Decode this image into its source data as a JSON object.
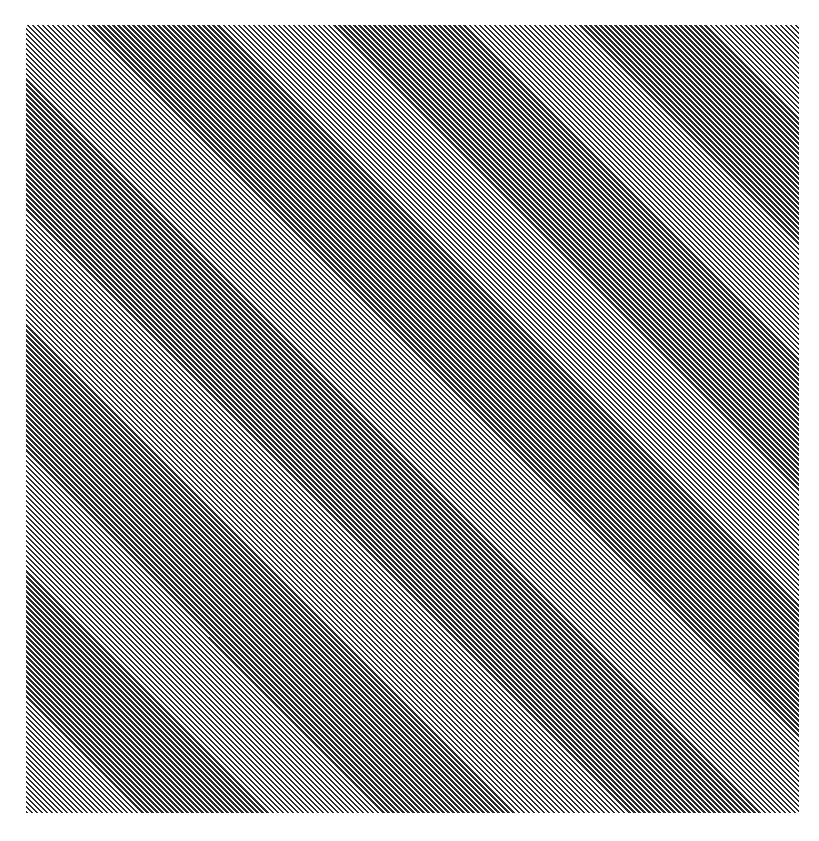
{
  "image": {
    "type": "diagonal-stripe-pattern",
    "stripe_direction": "top-left-to-bottom-right",
    "stripe_angle_deg": 45,
    "colors": {
      "stripe_dark": "#2a2a2a",
      "stripe_light": "#ffffff",
      "background": "#ffffff"
    },
    "pattern_bounds": {
      "x": 26,
      "y": 25,
      "width": 773,
      "height": 788
    }
  }
}
